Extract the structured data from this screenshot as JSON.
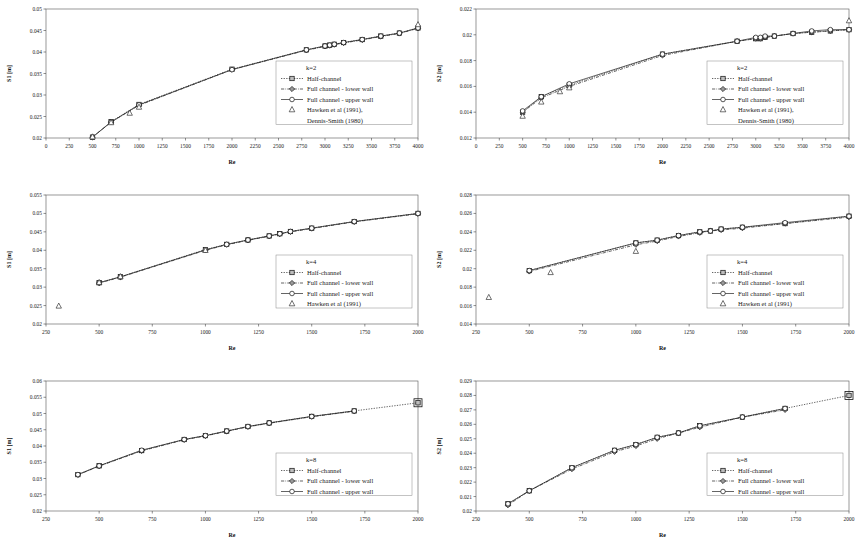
{
  "figure": {
    "panels_count": 6,
    "xlabel": "Re",
    "series_labels": {
      "half": "Half-channel",
      "lower": "Full channel - lower wall",
      "upper": "Full channel - upper wall",
      "ref_k2": "Hawken et al (1991), Dennis-Smith (1980)",
      "ref_k2_line1": "Hawken et al (1991),",
      "ref_k2_line2": "Dennis-Smith (1980)",
      "ref_k4": "Hawken et al (1991)"
    }
  },
  "chart_data": [
    {
      "id": "p1",
      "type": "scatter",
      "title": "",
      "k_label": "k=2",
      "xlabel": "Re",
      "ylabel": "S1 [m]",
      "xlim": [
        0,
        4000
      ],
      "ylim": [
        0.02,
        0.05
      ],
      "xticks": [
        0,
        250,
        500,
        750,
        1000,
        1250,
        1500,
        1750,
        2000,
        2250,
        2500,
        2750,
        3000,
        3250,
        3500,
        3750,
        4000
      ],
      "yticks": [
        0.02,
        0.025,
        0.03,
        0.035,
        0.04,
        0.045,
        0.05
      ],
      "grid": false,
      "legend_position": "inside-right",
      "series": [
        {
          "name": "Half-channel",
          "marker": "square",
          "line": "dotted",
          "x": [
            500,
            700,
            1000,
            2000,
            2800,
            3000,
            3050,
            3100,
            3200,
            3400,
            3600,
            3800,
            4000
          ],
          "y": [
            0.0202,
            0.0238,
            0.0278,
            0.036,
            0.0405,
            0.0414,
            0.0416,
            0.0418,
            0.0422,
            0.0429,
            0.0437,
            0.0444,
            0.0456
          ]
        },
        {
          "name": "Full channel - lower wall",
          "marker": "diamond",
          "line": "dashdot",
          "x": [
            500,
            700,
            1000,
            2000,
            2800,
            3000,
            3050,
            3100,
            3200,
            3400,
            3600,
            3800,
            4000
          ],
          "y": [
            0.0202,
            0.0237,
            0.0276,
            0.0359,
            0.0404,
            0.0413,
            0.0415,
            0.0417,
            0.0421,
            0.0428,
            0.0436,
            0.0443,
            0.0455
          ]
        },
        {
          "name": "Full channel - upper wall",
          "marker": "circle",
          "line": "solid",
          "x": [
            500,
            700,
            1000,
            2000,
            2800,
            3000,
            3050,
            3100,
            3200,
            3400,
            3600,
            3800,
            4000
          ],
          "y": [
            0.0202,
            0.0237,
            0.0277,
            0.0359,
            0.0405,
            0.0414,
            0.0416,
            0.0418,
            0.0422,
            0.0429,
            0.0437,
            0.0444,
            0.0456
          ]
        },
        {
          "name": "Hawken et al (1991), Dennis-Smith (1980)",
          "marker": "triangle",
          "line": "none",
          "x": [
            500,
            700,
            900,
            1000,
            4000
          ],
          "y": [
            0.0203,
            0.0236,
            0.0258,
            0.0272,
            0.0464
          ]
        }
      ]
    },
    {
      "id": "p2",
      "type": "scatter",
      "title": "",
      "k_label": "k=2",
      "xlabel": "Re",
      "ylabel": "S2 [m]",
      "xlim": [
        0,
        4000
      ],
      "ylim": [
        0.012,
        0.022
      ],
      "xticks": [
        0,
        250,
        500,
        750,
        1000,
        1250,
        1500,
        1750,
        2000,
        2250,
        2500,
        2750,
        3000,
        3250,
        3500,
        3750,
        4000
      ],
      "yticks": [
        0.012,
        0.014,
        0.016,
        0.018,
        0.02,
        0.022
      ],
      "grid": false,
      "legend_position": "inside-right",
      "series": [
        {
          "name": "Half-channel",
          "marker": "square",
          "line": "dotted",
          "x": [
            500,
            700,
            1000,
            2000,
            2800,
            3000,
            3050,
            3100,
            3200,
            3400,
            3600,
            3800,
            4000
          ],
          "y": [
            0.014,
            0.0152,
            0.0161,
            0.0185,
            0.0195,
            0.0197,
            0.0197,
            0.0198,
            0.0199,
            0.0201,
            0.0202,
            0.0203,
            0.0204
          ]
        },
        {
          "name": "Full channel - lower wall",
          "marker": "diamond",
          "line": "dashdot",
          "x": [
            500,
            700,
            1000,
            2000,
            2800,
            3000,
            3050,
            3100,
            3200,
            3400,
            3600,
            3800,
            4000
          ],
          "y": [
            0.014,
            0.0151,
            0.016,
            0.0184,
            0.0195,
            0.0197,
            0.0197,
            0.0198,
            0.0199,
            0.0201,
            0.0202,
            0.0203,
            0.0204
          ]
        },
        {
          "name": "Full channel - upper wall",
          "marker": "circle",
          "line": "solid",
          "x": [
            500,
            700,
            1000,
            2000,
            2800,
            3000,
            3050,
            3100,
            3200,
            3400,
            3600,
            3800,
            4000
          ],
          "y": [
            0.0141,
            0.0152,
            0.0162,
            0.0185,
            0.0195,
            0.0198,
            0.0198,
            0.0199,
            0.0199,
            0.0201,
            0.0203,
            0.0204,
            0.0204
          ]
        },
        {
          "name": "Hawken et al (1991), Dennis-Smith (1980)",
          "marker": "triangle",
          "line": "none",
          "x": [
            500,
            700,
            900,
            1000,
            4000
          ],
          "y": [
            0.0137,
            0.0148,
            0.0156,
            0.0159,
            0.0211
          ]
        }
      ]
    },
    {
      "id": "p3",
      "type": "scatter",
      "title": "",
      "k_label": "k=4",
      "xlabel": "Re",
      "ylabel": "S1 [m]",
      "xlim": [
        250,
        2000
      ],
      "ylim": [
        0.02,
        0.055
      ],
      "xticks": [
        250,
        500,
        750,
        1000,
        1250,
        1500,
        1750,
        2000
      ],
      "yticks": [
        0.02,
        0.025,
        0.03,
        0.035,
        0.04,
        0.045,
        0.05,
        0.055
      ],
      "grid": false,
      "legend_position": "inside-right",
      "series": [
        {
          "name": "Half-channel",
          "marker": "square",
          "line": "dotted",
          "x": [
            500,
            600,
            1000,
            1100,
            1200,
            1300,
            1350,
            1400,
            1500,
            1700,
            2000
          ],
          "y": [
            0.0312,
            0.0328,
            0.0402,
            0.0416,
            0.0428,
            0.0439,
            0.0445,
            0.0451,
            0.046,
            0.0478,
            0.05
          ]
        },
        {
          "name": "Full channel - lower wall",
          "marker": "diamond",
          "line": "dashdot",
          "x": [
            500,
            600,
            1000,
            1100,
            1200,
            1300,
            1350,
            1400,
            1500,
            1700,
            2000
          ],
          "y": [
            0.0311,
            0.0327,
            0.04,
            0.0415,
            0.0427,
            0.0438,
            0.0444,
            0.045,
            0.0459,
            0.0477,
            0.0499
          ]
        },
        {
          "name": "Full channel - upper wall",
          "marker": "circle",
          "line": "solid",
          "x": [
            500,
            600,
            1000,
            1100,
            1200,
            1300,
            1350,
            1400,
            1500,
            1700,
            2000
          ],
          "y": [
            0.0312,
            0.0328,
            0.0401,
            0.0416,
            0.0428,
            0.0439,
            0.0445,
            0.0451,
            0.046,
            0.0478,
            0.05
          ]
        },
        {
          "name": "Hawken et al (1991)",
          "marker": "triangle",
          "line": "none",
          "x": [
            310,
            500,
            600,
            1000
          ],
          "y": [
            0.0249,
            0.0313,
            0.0329,
            0.04
          ]
        }
      ]
    },
    {
      "id": "p4",
      "type": "scatter",
      "title": "",
      "k_label": "k=4",
      "xlabel": "Re",
      "ylabel": "S2 [m]",
      "xlim": [
        250,
        2000
      ],
      "ylim": [
        0.014,
        0.028
      ],
      "xticks": [
        250,
        500,
        750,
        1000,
        1250,
        1500,
        1750,
        2000
      ],
      "yticks": [
        0.014,
        0.016,
        0.018,
        0.02,
        0.022,
        0.024,
        0.026,
        0.028
      ],
      "grid": false,
      "legend_position": "inside-right",
      "series": [
        {
          "name": "Half-channel",
          "marker": "square",
          "line": "dotted",
          "x": [
            500,
            1000,
            1100,
            1200,
            1300,
            1350,
            1400,
            1500,
            1700,
            2000
          ],
          "y": [
            0.0198,
            0.0228,
            0.0231,
            0.0236,
            0.024,
            0.0241,
            0.0243,
            0.0245,
            0.0249,
            0.0257
          ]
        },
        {
          "name": "Full channel - lower wall",
          "marker": "diamond",
          "line": "dashdot",
          "x": [
            500,
            1000,
            1100,
            1200,
            1300,
            1350,
            1400,
            1500,
            1700,
            2000
          ],
          "y": [
            0.0197,
            0.0226,
            0.023,
            0.0235,
            0.0239,
            0.0241,
            0.0242,
            0.0244,
            0.0249,
            0.0256
          ]
        },
        {
          "name": "Full channel - upper wall",
          "marker": "circle",
          "line": "solid",
          "x": [
            500,
            1000,
            1100,
            1200,
            1300,
            1350,
            1400,
            1500,
            1700,
            2000
          ],
          "y": [
            0.0198,
            0.0228,
            0.0231,
            0.0236,
            0.024,
            0.0241,
            0.0243,
            0.0245,
            0.025,
            0.0257
          ]
        },
        {
          "name": "Hawken et al (1991)",
          "marker": "triangle",
          "line": "none",
          "x": [
            310,
            600,
            1000
          ],
          "y": [
            0.0169,
            0.0196,
            0.0219
          ]
        }
      ]
    },
    {
      "id": "p5",
      "type": "scatter",
      "title": "",
      "k_label": "k=8",
      "xlabel": "Re",
      "ylabel": "S1 [m]",
      "xlim": [
        250,
        2000
      ],
      "ylim": [
        0.02,
        0.06
      ],
      "xticks": [
        250,
        500,
        750,
        1000,
        1250,
        1500,
        1750,
        2000
      ],
      "yticks": [
        0.02,
        0.025,
        0.03,
        0.035,
        0.04,
        0.045,
        0.05,
        0.055,
        0.06
      ],
      "grid": false,
      "legend_position": "inside-right",
      "series": [
        {
          "name": "Half-channel",
          "marker": "square",
          "line": "dotted",
          "x": [
            400,
            500,
            700,
            900,
            1000,
            1100,
            1200,
            1300,
            1500,
            1700,
            2000
          ],
          "y": [
            0.0312,
            0.0339,
            0.0386,
            0.042,
            0.0432,
            0.0446,
            0.046,
            0.0471,
            0.0491,
            0.0508,
            0.0533
          ]
        },
        {
          "name": "Full channel - lower wall",
          "marker": "diamond",
          "line": "dashdot",
          "x": [
            400,
            500,
            700,
            900,
            1000,
            1100,
            1200,
            1300,
            1500,
            1700
          ],
          "y": [
            0.0311,
            0.0338,
            0.0385,
            0.0419,
            0.0431,
            0.0445,
            0.0459,
            0.047,
            0.049,
            0.0507
          ]
        },
        {
          "name": "Full channel - upper wall",
          "marker": "circle",
          "line": "solid",
          "x": [
            400,
            500,
            700,
            900,
            1000,
            1100,
            1200,
            1300,
            1500,
            1700
          ],
          "y": [
            0.0312,
            0.0339,
            0.0387,
            0.042,
            0.0432,
            0.0446,
            0.046,
            0.0471,
            0.0491,
            0.0508
          ]
        }
      ]
    },
    {
      "id": "p6",
      "type": "scatter",
      "title": "",
      "k_label": "k=8",
      "xlabel": "Re",
      "ylabel": "S2 [m]",
      "xlim": [
        250,
        2000
      ],
      "ylim": [
        0.02,
        0.029
      ],
      "xticks": [
        250,
        500,
        750,
        1000,
        1250,
        1500,
        1750,
        2000
      ],
      "yticks": [
        0.02,
        0.021,
        0.022,
        0.023,
        0.024,
        0.025,
        0.026,
        0.027,
        0.028,
        0.029
      ],
      "grid": false,
      "legend_position": "inside-right",
      "series": [
        {
          "name": "Half-channel",
          "marker": "square",
          "line": "dotted",
          "x": [
            400,
            500,
            700,
            900,
            1000,
            1100,
            1200,
            1300,
            1500,
            1700,
            2000
          ],
          "y": [
            0.0205,
            0.0214,
            0.023,
            0.0242,
            0.0246,
            0.0251,
            0.0254,
            0.0259,
            0.0265,
            0.0271,
            0.028
          ]
        },
        {
          "name": "Full channel - lower wall",
          "marker": "diamond",
          "line": "dashdot",
          "x": [
            400,
            500,
            700,
            900,
            1000,
            1100,
            1200,
            1300,
            1500,
            1700
          ],
          "y": [
            0.0204,
            0.0214,
            0.0229,
            0.0241,
            0.0245,
            0.025,
            0.0254,
            0.0258,
            0.0265,
            0.027
          ]
        },
        {
          "name": "Full channel - upper wall",
          "marker": "circle",
          "line": "solid",
          "x": [
            400,
            500,
            700,
            900,
            1000,
            1100,
            1200,
            1300,
            1500,
            1700
          ],
          "y": [
            0.0205,
            0.0214,
            0.023,
            0.0242,
            0.0246,
            0.0251,
            0.0254,
            0.0259,
            0.0265,
            0.0271
          ]
        }
      ]
    }
  ]
}
